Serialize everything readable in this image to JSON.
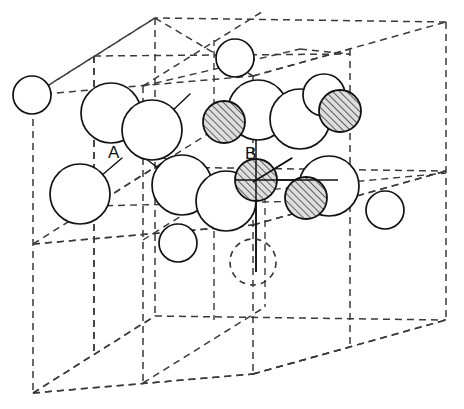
{
  "figure": {
    "background_color": "#ffffff",
    "line_color": "#333333",
    "atom_outline_color": "#111111",
    "atom_fill_color": "#ffffff",
    "hatch_color": "#555555",
    "hatch_fill_color": "#d8d8d8",
    "label_color": "#111111"
  },
  "labels": [
    {
      "text": "A",
      "x": 108,
      "y": 152
    },
    {
      "text": "B",
      "x": 247,
      "y": 153
    }
  ],
  "cube": {
    "type": "dashed-cube",
    "front_face": [
      [
        33,
        95
      ],
      [
        253,
        76
      ],
      [
        446,
        173
      ],
      [
        214,
        195
      ]
    ],
    "vertices": {
      "front_top_left": [
        33,
        95
      ],
      "front_top_right": [
        253,
        76
      ],
      "back_top_left": [
        155,
        18
      ],
      "back_top_right": [
        446,
        22
      ],
      "front_bottom_left": [
        33,
        393
      ],
      "front_bottom_right": [
        253,
        374
      ],
      "back_bottom_left": [
        155,
        316
      ],
      "back_bottom_right": [
        446,
        320
      ],
      "mid_right": [
        446,
        173
      ]
    },
    "subdivisions": 2
  },
  "atoms": {
    "open_large_radius": 29,
    "open_small_radius": 19,
    "hatched_radius": 20,
    "open_circles": [
      {
        "id": "o1",
        "cx": 32,
        "cy": 95,
        "r": 19,
        "kind": "open-small"
      },
      {
        "id": "o2",
        "cx": 111,
        "cy": 113,
        "r": 29,
        "kind": "open-large"
      },
      {
        "id": "o3",
        "cx": 152,
        "cy": 130,
        "r": 29,
        "kind": "open-large"
      },
      {
        "id": "o4",
        "cx": 80,
        "cy": 194,
        "r": 29,
        "kind": "open-large"
      },
      {
        "id": "o5",
        "cx": 182,
        "cy": 185,
        "r": 29,
        "kind": "open-large"
      },
      {
        "id": "o6",
        "cx": 226,
        "cy": 201,
        "r": 29,
        "kind": "open-large"
      },
      {
        "id": "o7",
        "cx": 235,
        "cy": 58,
        "r": 19,
        "kind": "open-small"
      },
      {
        "id": "o8",
        "cx": 258,
        "cy": 110,
        "r": 29,
        "kind": "open-large"
      },
      {
        "id": "o9",
        "cx": 300,
        "cy": 119,
        "r": 29,
        "kind": "open-large"
      },
      {
        "id": "o10",
        "cx": 324,
        "cy": 95,
        "r": 21,
        "kind": "open-medium"
      },
      {
        "id": "o11",
        "cx": 329,
        "cy": 186,
        "r": 29,
        "kind": "open-large"
      },
      {
        "id": "o12",
        "cx": 178,
        "cy": 243,
        "r": 19,
        "kind": "open-small"
      },
      {
        "id": "o13",
        "cx": 385,
        "cy": 210,
        "r": 19,
        "kind": "open-small"
      }
    ],
    "hatched_circles": [
      {
        "id": "h1",
        "cx": 224,
        "cy": 122,
        "r": 20
      },
      {
        "id": "h2",
        "cx": 340,
        "cy": 111,
        "r": 20
      },
      {
        "id": "h3",
        "cx": 256,
        "cy": 180,
        "r": 20
      },
      {
        "id": "h4",
        "cx": 306,
        "cy": 198,
        "r": 20
      }
    ],
    "dashed_circles": [
      {
        "id": "d1",
        "cx": 253,
        "cy": 262,
        "r": 23
      }
    ]
  },
  "bond_lines": [
    {
      "from": [
        111,
        113
      ],
      "to": [
        152,
        152
      ]
    },
    {
      "from": [
        152,
        130
      ],
      "to": [
        186,
        96
      ]
    },
    {
      "from": [
        80,
        194
      ],
      "to": [
        152,
        130
      ]
    },
    {
      "from": [
        80,
        194
      ],
      "to": [
        120,
        163
      ]
    },
    {
      "from": [
        152,
        152
      ],
      "to": [
        226,
        180
      ]
    },
    {
      "from": [
        226,
        201
      ],
      "to": [
        256,
        180
      ]
    },
    {
      "from": [
        256,
        180
      ],
      "to": [
        291,
        160
      ]
    }
  ],
  "axis_lines": [
    {
      "orientation": "vertical",
      "from": [
        256,
        100
      ],
      "to": [
        256,
        264
      ]
    },
    {
      "orientation": "horizontal",
      "from": [
        160,
        180
      ],
      "to": [
        332,
        180
      ]
    },
    {
      "orientation": "horizontal",
      "from": [
        200,
        180
      ],
      "to": [
        256,
        180
      ]
    }
  ]
}
